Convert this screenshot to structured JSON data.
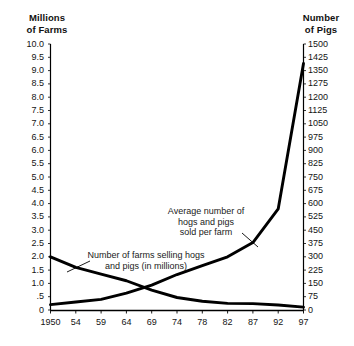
{
  "headings": {
    "left": "Millions\nof Farms",
    "right": "Number\nof Pigs"
  },
  "annotations": {
    "pigs": "Average number of\nhogs and pigs\nsold per farm",
    "farms": "Number of farms selling hogs\nand pigs (in millions)"
  },
  "chart_data": {
    "type": "line",
    "title": "",
    "xlabel": "",
    "ylabel": "Millions of Farms",
    "y2label": "Number of Pigs",
    "grid": false,
    "legend": "annotations-inline",
    "x": [
      1950,
      1954,
      1959,
      1964,
      1969,
      1974,
      1978,
      1982,
      1987,
      1992,
      1997
    ],
    "xtick_labels": [
      "1950",
      "54",
      "59",
      "64",
      "69",
      "74",
      "78",
      "82",
      "87",
      "92",
      "97"
    ],
    "left_axis": {
      "label": "Millions of Farms",
      "ticks": [
        "10.0",
        "9.5",
        "9.0",
        "8.5",
        "8.0",
        "7.5",
        "7.0",
        "6.5",
        "6.0",
        "5.5",
        "5.0",
        "4.5",
        "4.0",
        "3.5",
        "3.0",
        "2.5",
        "2.0",
        "1.5",
        "1.0",
        ".5",
        "0"
      ],
      "tick_values": [
        10.0,
        9.5,
        9.0,
        8.5,
        8.0,
        7.5,
        7.0,
        6.5,
        6.0,
        5.5,
        5.0,
        4.5,
        4.0,
        3.5,
        3.0,
        2.5,
        2.0,
        1.5,
        1.0,
        0.5,
        0.0
      ],
      "ylim": [
        0,
        10
      ]
    },
    "right_axis": {
      "label": "Number of Pigs",
      "ticks": [
        "1500",
        "1425",
        "1350",
        "1275",
        "1200",
        "1125",
        "1050",
        "975",
        "900",
        "825",
        "750",
        "675",
        "600",
        "525",
        "450",
        "375",
        "300",
        "225",
        "150",
        "75",
        "0"
      ],
      "tick_values": [
        1500,
        1425,
        1350,
        1275,
        1200,
        1125,
        1050,
        975,
        900,
        825,
        750,
        675,
        600,
        525,
        450,
        375,
        300,
        225,
        150,
        75,
        0
      ],
      "ylim": [
        0,
        1500
      ]
    },
    "series": [
      {
        "name": "Number of farms selling hogs and pigs (in millions)",
        "axis": "left",
        "units": "millions of farms",
        "values": [
          2.0,
          1.6,
          1.35,
          1.1,
          0.75,
          0.47,
          0.33,
          0.25,
          0.24,
          0.19,
          0.11
        ]
      },
      {
        "name": "Average number of hogs and pigs sold per farm",
        "axis": "right",
        "units": "pigs per farm",
        "values": [
          30,
          45,
          60,
          95,
          140,
          200,
          250,
          300,
          380,
          570,
          1390
        ]
      }
    ]
  }
}
